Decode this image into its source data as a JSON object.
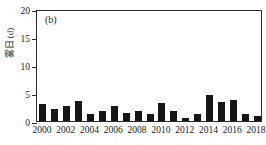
{
  "chart_data": {
    "type": "bar",
    "title": "",
    "panel_label": "(b)",
    "xlabel": "",
    "ylabel": "雾日 (d)",
    "ylim": [
      0,
      20
    ],
    "yticks": [
      0,
      5,
      10,
      15,
      20
    ],
    "ytick_labels": [
      "0",
      "5",
      "10",
      "15",
      "20"
    ],
    "grid": false,
    "legend": null,
    "bar_color": "#161616",
    "axis_color": "#2b2b2b",
    "xtick_labels": [
      "2000",
      "2002",
      "2004",
      "2006",
      "2008",
      "2010",
      "2012",
      "2014",
      "2016",
      "2018"
    ],
    "categories": [
      "2000",
      "2001",
      "2002",
      "2003",
      "2004",
      "2005",
      "2006",
      "2007",
      "2008",
      "2009",
      "2010",
      "2011",
      "2012",
      "2013",
      "2014",
      "2015",
      "2016",
      "2017",
      "2018"
    ],
    "values": [
      3.0,
      2.1,
      2.7,
      3.5,
      1.2,
      1.8,
      2.7,
      1.5,
      1.7,
      1.2,
      3.2,
      1.8,
      0.6,
      1.2,
      4.6,
      3.4,
      3.8,
      1.2,
      0.9
    ]
  }
}
